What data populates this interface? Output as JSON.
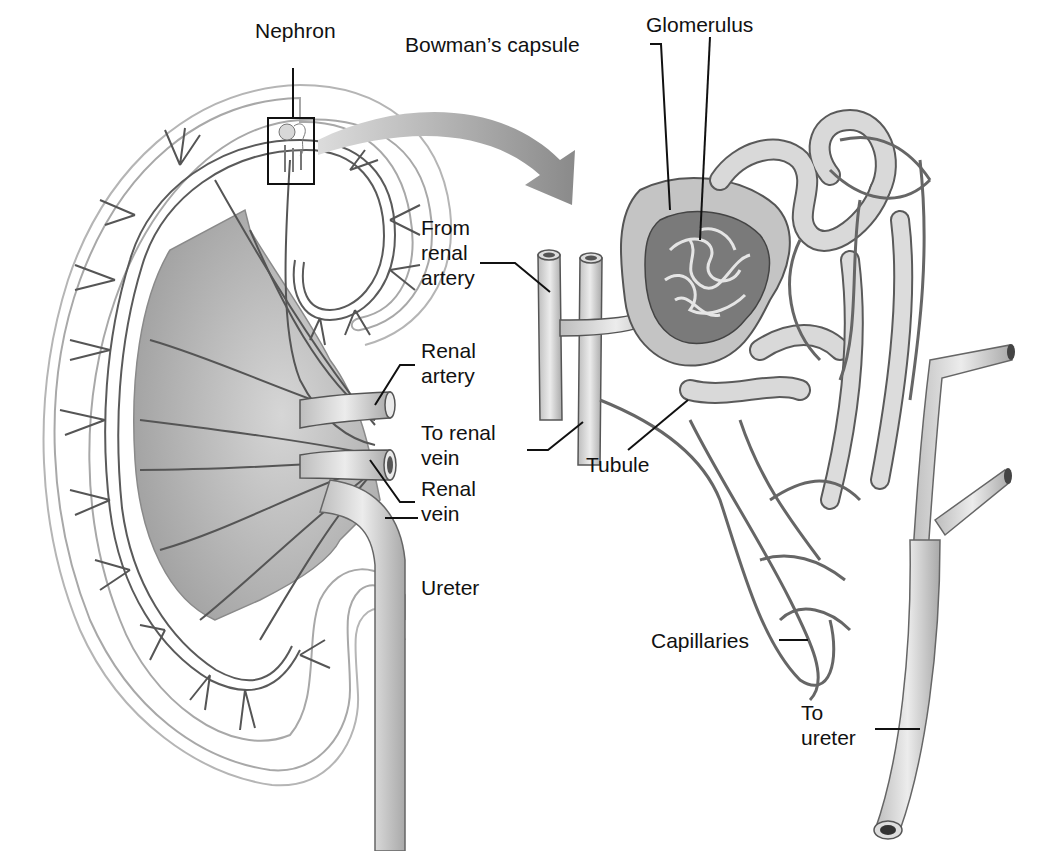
{
  "labels": {
    "nephron": "Nephron",
    "bowmans_capsule": "Bowman’s capsule",
    "glomerulus": "Glomerulus",
    "from_renal_artery": "From\nrenal\nartery",
    "renal_artery": "Renal\nartery",
    "to_renal_vein": "To renal\nvein",
    "renal_vein": "Renal\nvein",
    "tubule": "Tubule",
    "ureter": "Ureter",
    "capillaries": "Capillaries",
    "to_ureter": "To\nureter"
  },
  "colors": {
    "vessel_fill": "#c9c9c9",
    "vessel_stroke": "#555555",
    "kidney_outline": "#a8a8a8",
    "medulla_fill": "#b8b8b8",
    "arrow_fill": "#9a9a9a",
    "text": "#111111"
  }
}
